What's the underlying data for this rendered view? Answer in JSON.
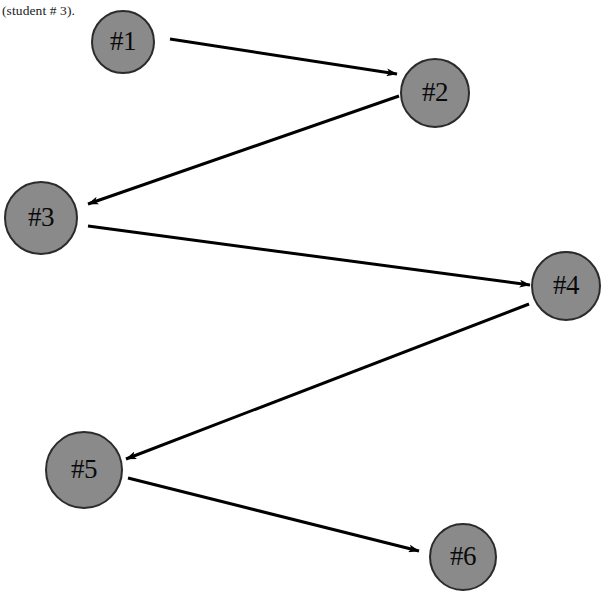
{
  "canvas": {
    "width": 606,
    "height": 600,
    "background": "#ffffff"
  },
  "caption": {
    "text": "(student # 3).",
    "x": 2,
    "y": 2
  },
  "style": {
    "node_fill": "#8a8a8a",
    "node_stroke": "#2b2b2b",
    "node_stroke_width": 2,
    "label_color": "#0a0a0a",
    "edge_color": "#000000",
    "edge_width": 3
  },
  "chart_data": {
    "type": "diagram",
    "title": "(student # 3).",
    "layout": "directed-chain-zigzag",
    "nodes": [
      {
        "id": "n1",
        "label": "#1",
        "cx": 123,
        "cy": 42,
        "r": 32
      },
      {
        "id": "n2",
        "label": "#2",
        "cx": 435,
        "cy": 93,
        "r": 35
      },
      {
        "id": "n3",
        "label": "#3",
        "cx": 41,
        "cy": 218,
        "r": 37
      },
      {
        "id": "n4",
        "label": "#4",
        "cx": 566,
        "cy": 286,
        "r": 35
      },
      {
        "id": "n5",
        "label": "#5",
        "cx": 84,
        "cy": 470,
        "r": 39
      },
      {
        "id": "n6",
        "label": "#6",
        "cx": 463,
        "cy": 557,
        "r": 34
      }
    ],
    "edges": [
      {
        "id": "e1",
        "from": "n1",
        "to": "n2",
        "x1": 170,
        "y1": 39,
        "x2": 397,
        "y2": 74,
        "directed": true
      },
      {
        "id": "e2",
        "from": "n2",
        "to": "n3",
        "x1": 399,
        "y1": 96,
        "x2": 88,
        "y2": 204,
        "directed": true
      },
      {
        "id": "e3",
        "from": "n3",
        "to": "n4",
        "x1": 88,
        "y1": 226,
        "x2": 530,
        "y2": 285,
        "directed": true
      },
      {
        "id": "e4",
        "from": "n4",
        "to": "n5",
        "x1": 529,
        "y1": 304,
        "x2": 126,
        "y2": 459,
        "directed": true
      },
      {
        "id": "e5",
        "from": "n5",
        "to": "n6",
        "x1": 128,
        "y1": 478,
        "x2": 419,
        "y2": 551,
        "directed": true
      }
    ]
  }
}
